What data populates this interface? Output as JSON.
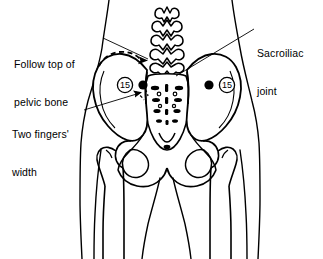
{
  "figure": {
    "view": "posterior view of lower torso, pelvis and upper legs",
    "background_color": "#ffffff",
    "line_color": "#000000",
    "width": 323,
    "height": 259
  },
  "annotations": {
    "follow_top": {
      "text": "Follow top of\npelvic bone",
      "line1": "Follow top of",
      "line2": "pelvic bone",
      "leader": "line from text to dashed arrow over left iliac crest"
    },
    "sacroiliac": {
      "text": "Sacroiliac\njoint",
      "line1": "Sacroiliac",
      "line2": "joint",
      "leader": "line from text down-left to sacroiliac joint region"
    },
    "two_fingers": {
      "text": "Two fingers'\nwidth",
      "line1": "Two fingers'",
      "line2": "width",
      "leader": "arrow from text up-right to dashed two-finger width marker"
    }
  },
  "points": [
    {
      "id": "point-left",
      "number": "15",
      "side": "left",
      "marker": "circled-number-with-filled-dot",
      "dot_position": "right-of-number"
    },
    {
      "id": "point-right",
      "number": "15",
      "side": "right",
      "marker": "circled-number-with-filled-dot",
      "dot_position": "left-of-number"
    }
  ],
  "anatomy": {
    "parts": [
      "lumbar-vertebrae",
      "sacrum",
      "sacral-foramina",
      "left-ilium",
      "right-ilium",
      "iliac-crest",
      "sacroiliac-joint",
      "pubic-symphysis",
      "obturator-foramen",
      "femoral-head",
      "greater-trochanter",
      "body-outline"
    ]
  }
}
